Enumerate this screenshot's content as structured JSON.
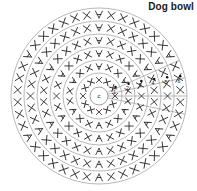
{
  "chart_data": {
    "type": "diagram",
    "title": "Dog bowl",
    "subtitle": "",
    "xlabel": "",
    "ylabel": "",
    "diagram_kind": "crochet-round-chart",
    "center_label": "c",
    "center_radius": 9,
    "center": {
      "cx": 99,
      "cy": 96
    },
    "round_labels": [
      "1",
      "2",
      "3",
      "4",
      "5",
      "6"
    ],
    "round_radii": [
      23,
      36,
      49,
      62,
      75,
      88
    ],
    "rounds": [
      {
        "label": "1",
        "radius": 23,
        "stitch_count": 12,
        "increase_count": 6,
        "symbol": "x"
      },
      {
        "label": "2",
        "radius": 36,
        "stitch_count": 18,
        "increase_count": 6,
        "symbol": "x"
      },
      {
        "label": "3",
        "radius": 49,
        "stitch_count": 24,
        "increase_count": 6,
        "symbol": "x"
      },
      {
        "label": "4",
        "radius": 62,
        "stitch_count": 30,
        "increase_count": 6,
        "symbol": "x"
      },
      {
        "label": "5",
        "radius": 75,
        "stitch_count": 36,
        "increase_count": 6,
        "symbol": "x"
      },
      {
        "label": "6",
        "radius": 88,
        "stitch_count": 42,
        "increase_count": 6,
        "symbol": "x"
      }
    ],
    "symbols": {
      "single_crochet": "x",
      "increase": "v"
    },
    "colors": {
      "title": "#1a1a1a",
      "ring": "#9a9a9a",
      "stitch": "#2b2b2b",
      "dot": "#111111",
      "background": "#ffffff"
    }
  }
}
